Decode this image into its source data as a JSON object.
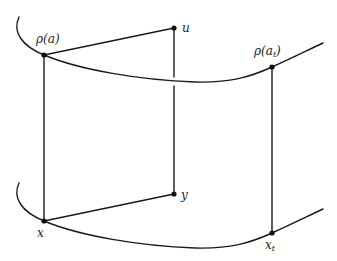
{
  "diagram": {
    "colors": {
      "stroke": "#1a1a1a",
      "background": "#ffffff"
    },
    "labels": {
      "rho_a": "ρ(a)",
      "rho_at_base": "ρ(a",
      "rho_at_sub": "t",
      "rho_at_close": ")",
      "u": "u",
      "y": "y",
      "x": "x",
      "xt_base": "x",
      "xt_sub": "t"
    },
    "points": {
      "rho_a": [
        44,
        55
      ],
      "u": [
        174,
        28
      ],
      "rho_at": [
        272,
        67
      ],
      "y": [
        174,
        194
      ],
      "x": [
        44,
        221
      ],
      "x_t": [
        272,
        233
      ]
    },
    "curves": [
      "upper-curve",
      "lower-curve"
    ],
    "segments": [
      "rho_a-u",
      "rho_a-x",
      "u-y",
      "x-y",
      "rho_at-x_t"
    ]
  }
}
